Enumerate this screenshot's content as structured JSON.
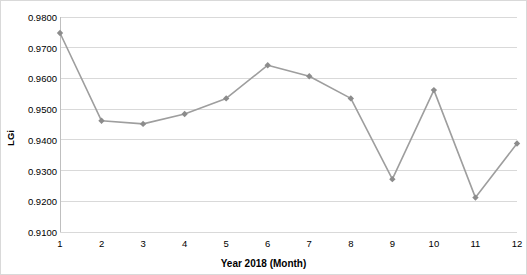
{
  "chart_data": {
    "type": "line",
    "title": "",
    "xlabel": "Year 2018 (Month)",
    "ylabel": "LGi",
    "categories": [
      "1",
      "2",
      "3",
      "4",
      "5",
      "6",
      "7",
      "8",
      "9",
      "10",
      "11",
      "12"
    ],
    "values": [
      0.9748,
      0.9462,
      0.9452,
      0.9484,
      0.9535,
      0.9643,
      0.9607,
      0.9535,
      0.9272,
      0.9562,
      0.9212,
      0.9388
    ],
    "series": [
      {
        "name": "LGi",
        "values": [
          0.9748,
          0.9462,
          0.9452,
          0.9484,
          0.9535,
          0.9643,
          0.9607,
          0.9535,
          0.9272,
          0.9562,
          0.9212,
          0.9388
        ]
      }
    ],
    "ylim": [
      0.91,
      0.98
    ],
    "ytick_labels": [
      "0.9100",
      "0.9200",
      "0.9300",
      "0.9400",
      "0.9500",
      "0.9600",
      "0.9700",
      "0.9800"
    ],
    "ytick_values": [
      0.91,
      0.92,
      0.93,
      0.94,
      0.95,
      0.96,
      0.97,
      0.98
    ],
    "xtick_labels": [
      "1",
      "2",
      "3",
      "4",
      "5",
      "6",
      "7",
      "8",
      "9",
      "10",
      "11",
      "12"
    ],
    "grid": "horizontal",
    "legend": "none",
    "line_color": "#9e9e9e",
    "marker_color": "#8c8c8c",
    "grid_color": "#d9d9d9",
    "axis_color": "#bfbfbf",
    "background": "#ffffff",
    "border_color": "#d9d9d9"
  }
}
